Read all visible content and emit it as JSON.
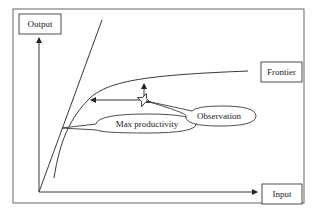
{
  "diagram": {
    "type": "production-frontier",
    "labels": {
      "y_axis": "Output",
      "x_axis": "Input",
      "frontier": "Frontier",
      "max_productivity": "Max productivity",
      "observation": "Observation"
    },
    "elements": {
      "frame": "rectangular border",
      "ray_from_origin": "steep line through origin tangent to frontier",
      "frontier_curve": "concave curve rising then flattening",
      "observation_point": "star marker below frontier",
      "output_oriented_arrow": "vertical arrow from observation up to frontier",
      "input_oriented_arrow": "horizontal arrow from observation left to frontier"
    },
    "colors": {
      "line": "#222222",
      "frame": "#555555",
      "background": "#ffffff"
    }
  }
}
